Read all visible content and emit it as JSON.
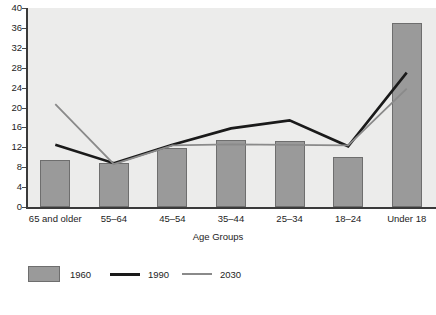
{
  "chart_data": {
    "type": "bar",
    "title": "",
    "xlabel": "Age Groups",
    "ylabel": "",
    "categories": [
      "65 and older",
      "55–64",
      "45–54",
      "35–44",
      "25–34",
      "18–24",
      "Under 18"
    ],
    "yticks": [
      0,
      4,
      8,
      12,
      16,
      20,
      24,
      28,
      32,
      36,
      40
    ],
    "ylim": [
      0,
      40
    ],
    "grid": false,
    "legend_position": "bottom-left",
    "series": [
      {
        "name": "1960",
        "render": "bar",
        "color": "#9a9a9a",
        "values": [
          9.4,
          8.8,
          11.9,
          13.5,
          13.3,
          10.0,
          37.0
        ]
      },
      {
        "name": "1990",
        "render": "line",
        "color": "#1a1a1a",
        "values": [
          12.5,
          8.8,
          12.5,
          15.8,
          17.4,
          12.2,
          27.0
        ]
      },
      {
        "name": "2030",
        "render": "line",
        "color": "#8a8a8a",
        "values": [
          20.7,
          8.6,
          12.4,
          12.6,
          12.5,
          12.4,
          23.8
        ]
      }
    ]
  },
  "legend": {
    "items": [
      {
        "label": "1960",
        "type": "swatch",
        "color": "#9a9a9a"
      },
      {
        "label": "1990",
        "type": "line",
        "color": "#1a1a1a"
      },
      {
        "label": "2030",
        "type": "line",
        "color": "#8a8a8a"
      }
    ]
  }
}
